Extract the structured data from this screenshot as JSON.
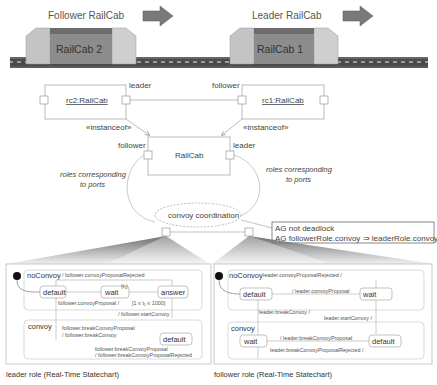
{
  "illustration": {
    "follower_title": "Follower RailCab",
    "leader_title": "Leader RailCab",
    "cab2_label": "RailCab 2",
    "cab1_label": "RailCab 1",
    "arrow_color": "#7a7a7a",
    "cab_body_color": "#8c8c8c",
    "cab_side_color": "#c4c4c4"
  },
  "instances": {
    "rc2": "rc2:RailCab",
    "rc1": "rc1:RailCab",
    "rc2_port": "leader",
    "rc1_port": "follower",
    "instanceof_left": "«instanceof»",
    "instanceof_right": "«instanceof»"
  },
  "component": {
    "name": "RailCab",
    "port_left": "follower",
    "port_right": "leader",
    "note_left_line1": "roles corresponding",
    "note_left_line2": "to ports",
    "note_right_line1": "roles corresponding",
    "note_right_line2": "to ports"
  },
  "pattern": {
    "name": "convoy coordination",
    "constraint_line1": "AG not deadlock",
    "constraint_line2": "AG followerRole.convoy ⇒ leaderRole.convoy"
  },
  "leader_role": {
    "caption": "leader role (Real-Time Statechart)",
    "noConvoy": "noConvoy",
    "rejected": "/ follower.convoyProposalRejected",
    "default": "default",
    "wait": "wait",
    "clock": "{t₁}",
    "answer": "answer",
    "proposal": "follower.convoyProposal /",
    "guard": "[1 ≤ t₁ ≤ 1000]",
    "start": "/ follower.startConvoy",
    "convoy": "convoy",
    "break1": "follower.breakConvoyProposal",
    "break2": "/ follower.breakConvoy",
    "convoy_default": "default",
    "break3": "follower.breakConvoyProposal",
    "break4": "/ follower.breakConvoyProposalRejected"
  },
  "follower_role": {
    "caption": "follower role (Real-Time Statechart)",
    "noConvoy": "noConvoy",
    "rejected": "leader.convoyProposalRejected /",
    "default": "default",
    "proposal": "/ leader.convoyProposal",
    "wait": "wait",
    "breakConvoy": "leader.breakConvoy /",
    "start": "leader.startConvoy /",
    "convoy": "convoy",
    "convoy_wait": "wait",
    "breakProposal": "/ leader.breakConvoyProposal",
    "convoy_default": "default",
    "breakRejected": "leader.breakConvoyProposalRejected /"
  }
}
